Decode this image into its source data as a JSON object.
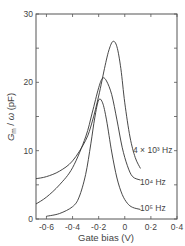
{
  "chart_data": {
    "type": "line",
    "title": "",
    "xlabel": "Gate bias (V)",
    "ylabel": "G_m / ω  (pF)",
    "xlim": [
      -0.68,
      0.4
    ],
    "ylim": [
      0,
      30
    ],
    "xticks": [
      -0.6,
      -0.4,
      -0.2,
      0,
      0.2,
      0.4
    ],
    "xtick_labels": [
      "-0·6",
      "-0·4",
      "-0·2",
      "0",
      "0·2",
      "0·4"
    ],
    "yticks": [
      0,
      10,
      20,
      30
    ],
    "ytick_labels": [
      "0",
      "10",
      "20",
      "30"
    ],
    "grid": false,
    "legend": "inline labels at curve ends",
    "series": [
      {
        "name": "4 x 10^3 Hz",
        "label_text": "4 × 10³ Hz",
        "x": [
          -0.68,
          -0.6,
          -0.5,
          -0.4,
          -0.3,
          -0.25,
          -0.2,
          -0.15,
          -0.12,
          -0.09,
          -0.06,
          -0.03,
          0,
          0.04,
          0.08,
          0.12
        ],
        "y": [
          5.9,
          6.2,
          7.0,
          8.5,
          11.5,
          14.2,
          18.0,
          22.5,
          24.8,
          26.0,
          25.2,
          22.0,
          17.0,
          12.0,
          9.0,
          7.4
        ]
      },
      {
        "name": "10^4 Hz",
        "label_text": "10⁴ Hz",
        "x": [
          -0.68,
          -0.6,
          -0.5,
          -0.4,
          -0.3,
          -0.25,
          -0.2,
          -0.17,
          -0.14,
          -0.1,
          -0.06,
          -0.02,
          0.02,
          0.06,
          0.12
        ],
        "y": [
          2.2,
          3.2,
          5.0,
          7.5,
          12.0,
          15.5,
          19.2,
          20.6,
          20.2,
          18.2,
          14.5,
          10.5,
          7.8,
          6.2,
          5.7
        ]
      },
      {
        "name": "10^5 Hz",
        "label_text": "10⁵ Hz",
        "x": [
          -0.6,
          -0.5,
          -0.4,
          -0.35,
          -0.3,
          -0.26,
          -0.23,
          -0.2,
          -0.17,
          -0.14,
          -0.1,
          -0.06,
          -0.02,
          0.02,
          0.06,
          0.12
        ],
        "y": [
          0.4,
          0.8,
          1.8,
          3.2,
          6.5,
          11.0,
          14.8,
          17.4,
          17.0,
          14.5,
          9.8,
          6.0,
          3.6,
          2.3,
          1.7,
          1.4
        ]
      }
    ]
  }
}
